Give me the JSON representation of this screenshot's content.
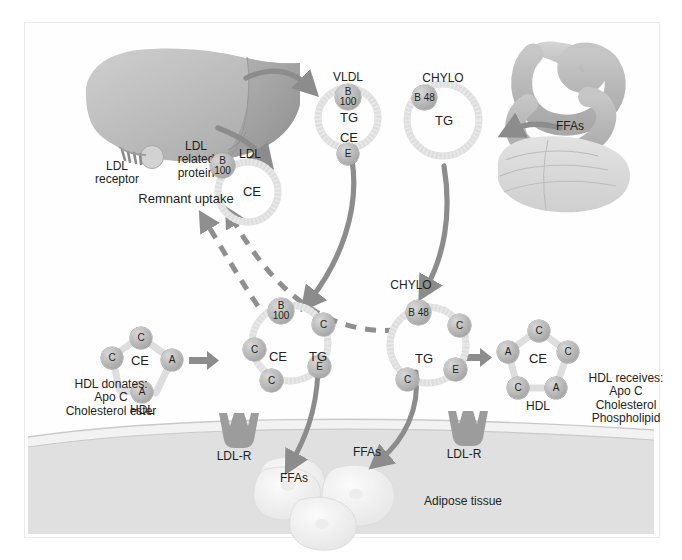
{
  "diagram": {
    "colors": {
      "arrow": "#8c8c8c",
      "organ_light": "#c9c9c9",
      "organ_dark": "#a0a0a0",
      "text": "#231f20",
      "membrane": "#dcdcdc",
      "particle_ring": "#dedede"
    }
  },
  "organs": {
    "liver": {
      "name": "liver",
      "receptor_label": "LDL\nreceptor",
      "related_protein_label": "LDL\nrelated\nprotein"
    },
    "intestine": {
      "name": "intestine",
      "ffa_label": "FFAs"
    },
    "adipose": {
      "name": "adipose-tissue",
      "label": "Adipose tissue"
    }
  },
  "particles": {
    "ldl": {
      "title": "LDL",
      "apos": [
        "B\n100"
      ],
      "core": [
        "CE"
      ]
    },
    "vldl": {
      "title": "VLDL",
      "apos": [
        "B\n100",
        "E"
      ],
      "core": [
        "TG",
        "CE"
      ]
    },
    "chylo": {
      "title": "CHYLO",
      "apos": [
        "B\n48"
      ],
      "core": [
        "TG"
      ]
    },
    "vldl_remnant": {
      "title": "",
      "apos": [
        "B\n100",
        "C",
        "C",
        "C",
        "E"
      ],
      "core": [
        "CE",
        "TG"
      ]
    },
    "chylo_remnant": {
      "title": "CHYLO",
      "apos": [
        "B\n48",
        "C",
        "C",
        "E"
      ],
      "core": [
        "TG"
      ]
    },
    "hdl_left": {
      "title": "HDL",
      "apos": [
        "C",
        "C",
        "A",
        "A"
      ],
      "core": [
        "CE"
      ]
    },
    "hdl_right": {
      "title": "HDL",
      "apos": [
        "C",
        "C",
        "A",
        "A",
        "C"
      ],
      "core": [
        "CE"
      ]
    }
  },
  "labels": {
    "remnant_uptake": "Remnant uptake",
    "hdl_donates": "HDL donates:\nApo C\nCholesterol ester",
    "hdl_receives": "HDL receives:\nApo C\nCholesterol\nPhospholipid",
    "ldl_r_left": "LDL-R",
    "ldl_r_right": "LDL-R",
    "ffa_adipose_left": "FFAs",
    "ffa_adipose_right": "FFAs",
    "ffa_intestine": "FFAs",
    "adipose_tissue": "Adipose tissue"
  }
}
